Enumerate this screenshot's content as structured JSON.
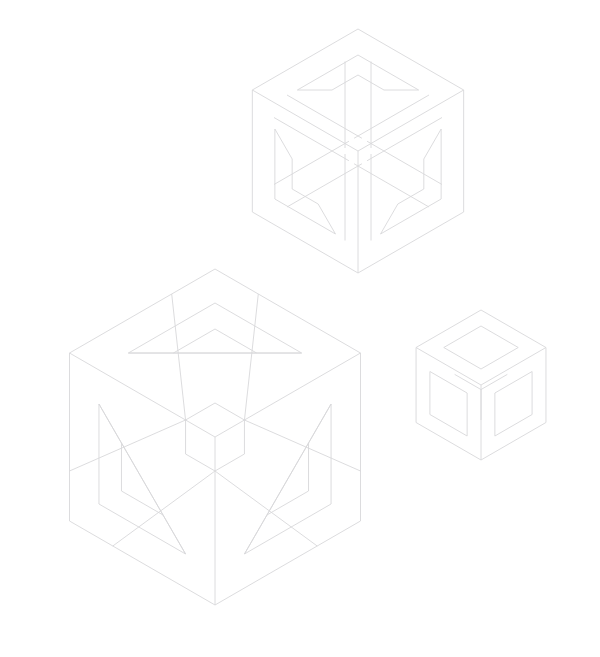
{
  "figure": {
    "background_color": "#ffffff",
    "stroke_color": "#d8d8da",
    "stroke_width": 0.9,
    "canvas": {
      "width": 600,
      "height": 657
    },
    "object_count": 3,
    "objects": [
      {
        "name": "top-cube",
        "label": "Top impossible cube",
        "style": "pinwheel-frame",
        "center": {
          "x": 358,
          "y": 151
        },
        "radius": 122,
        "band": 26,
        "inner_band": 20
      },
      {
        "name": "large-cube",
        "label": "Large impossible cube",
        "style": "notched-triangle-frame",
        "center": {
          "x": 215,
          "y": 437
        },
        "radius": 168,
        "band": 34,
        "inner_band": 26
      },
      {
        "name": "small-cube",
        "label": "Small hollow cube",
        "style": "hollow-frame",
        "center": {
          "x": 481,
          "y": 385
        },
        "radius": 75,
        "band": 16,
        "inner_band": 12
      }
    ]
  }
}
